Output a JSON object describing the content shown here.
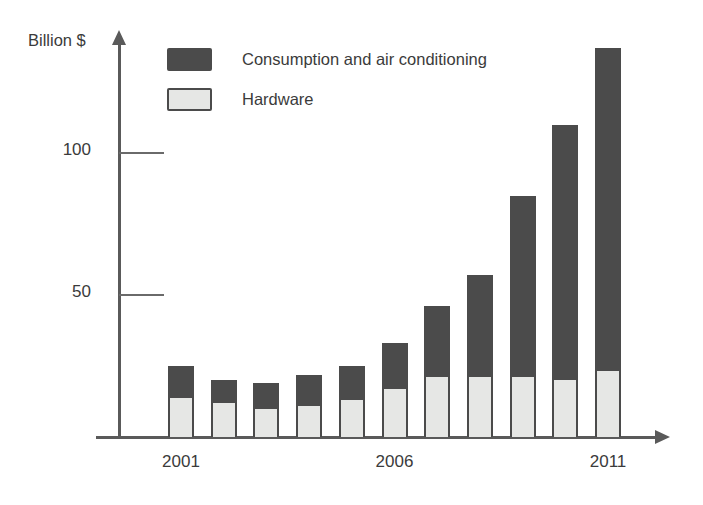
{
  "chart_data": {
    "type": "bar",
    "title": "",
    "subtitle": "",
    "xlabel": "",
    "ylabel": "Billion $",
    "stacked": true,
    "grid": false,
    "legend_position": "top-left",
    "ylim": [
      0,
      140
    ],
    "ytick_labels": [
      "50",
      "100"
    ],
    "yticks": [
      50,
      100
    ],
    "categories": [
      "2001",
      "2002",
      "2003",
      "2004",
      "2005",
      "2006",
      "2007",
      "2008",
      "2009",
      "2010",
      "2011"
    ],
    "visible_xtick_labels": [
      "2001",
      "2006",
      "2011"
    ],
    "series": [
      {
        "name": "Hardware",
        "color": "#e6e7e5",
        "values": [
          15,
          13,
          11,
          12,
          14,
          18,
          22,
          22,
          22,
          21,
          24
        ]
      },
      {
        "name": "Consumption and air conditioning",
        "color": "#4b4b4b",
        "values": [
          10,
          7,
          8,
          10,
          11,
          15,
          24,
          35,
          63,
          89,
          113
        ]
      }
    ],
    "totals": [
      25,
      20,
      19,
      22,
      25,
      33,
      46,
      57,
      85,
      110,
      137
    ],
    "annotations": []
  },
  "axis": {
    "y_title": "Billion $",
    "ticks": [
      {
        "label": "100",
        "value": 100
      },
      {
        "label": "50",
        "value": 50
      }
    ]
  },
  "legend": {
    "items": [
      {
        "label": "Consumption and air conditioning",
        "swatch": "dark"
      },
      {
        "label": "Hardware",
        "swatch": "light"
      }
    ]
  },
  "x_axis_labels": [
    {
      "text": "2001",
      "index": 0
    },
    {
      "text": "2006",
      "index": 5
    },
    {
      "text": "2011",
      "index": 10
    }
  ],
  "colors": {
    "dark_segment": "#4b4b4b",
    "light_segment": "#e6e7e5",
    "outline": "#4b4b4b",
    "axis": "#5a5a5a",
    "text": "#3b3b3b",
    "background": "#ffffff"
  }
}
